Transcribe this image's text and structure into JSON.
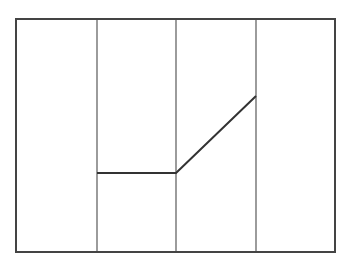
{
  "diagram": {
    "width": 344,
    "height": 264,
    "background": "#ffffff",
    "frame": {
      "x": 16,
      "y": 19,
      "width": 319,
      "height": 233,
      "stroke": "#444444",
      "stroke_width": 2
    },
    "dividers": [
      {
        "x": 97,
        "y1": 19,
        "y2": 252,
        "stroke": "#666666",
        "stroke_width": 1.3
      },
      {
        "x": 176,
        "y1": 19,
        "y2": 252,
        "stroke": "#666666",
        "stroke_width": 1.3
      },
      {
        "x": 256,
        "y1": 19,
        "y2": 252,
        "stroke": "#666666",
        "stroke_width": 1.3
      }
    ],
    "polyline": {
      "points": [
        [
          97,
          173
        ],
        [
          176,
          173
        ],
        [
          256,
          96
        ]
      ],
      "stroke": "#333333",
      "stroke_width": 2
    }
  }
}
